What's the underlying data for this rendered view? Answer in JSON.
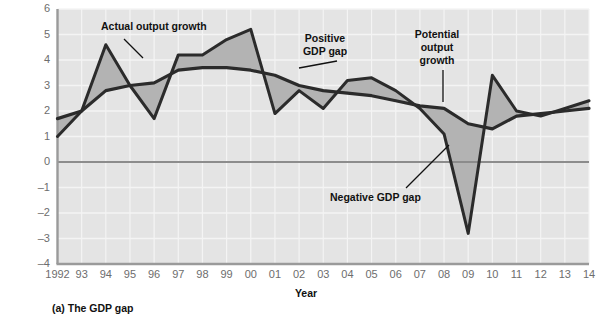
{
  "caption": "(a) The GDP gap",
  "axes": {
    "ylabel_line1": "Year-over-year",
    "ylabel_line2": "percentage change at annual rate",
    "xlabel": "Year",
    "yticks": [
      "6",
      "5",
      "4",
      "3",
      "2",
      "1",
      "0",
      "–1",
      "–2",
      "–3",
      "–4"
    ],
    "xticks": [
      "1992",
      "93",
      "94",
      "95",
      "96",
      "97",
      "98",
      "99",
      "00",
      "01",
      "02",
      "03",
      "04",
      "05",
      "06",
      "07",
      "08",
      "09",
      "10",
      "11",
      "12",
      "13",
      "14"
    ]
  },
  "annotations": {
    "actual": "Actual output growth",
    "positive": "Positive\nGDP gap",
    "potential": "Potential\noutput\ngrowth",
    "negative": "Negative GDP gap"
  },
  "colors": {
    "plot_background": "#e4e4e4",
    "gridline": "#f4f4f4",
    "axis": "#9a9a9a",
    "zero_line": "#8c8c8c",
    "series_line": "#2b2b2b",
    "gap_fill": "#b3b3b3",
    "tick_text": "#6d6d6d",
    "label_text": "#111111"
  },
  "chart_data": {
    "type": "line",
    "title": "(a) The GDP gap",
    "xlabel": "Year",
    "ylabel": "Year-over-year percentage change at annual rate",
    "xlim": [
      1992,
      2014
    ],
    "ylim": [
      -4,
      6
    ],
    "grid": true,
    "legend": "annotations",
    "x": [
      1992,
      1993,
      1994,
      1995,
      1996,
      1997,
      1998,
      1999,
      2000,
      2001,
      2002,
      2003,
      2004,
      2005,
      2006,
      2007,
      2008,
      2009,
      2010,
      2011,
      2012,
      2013,
      2014
    ],
    "series": [
      {
        "name": "Actual output growth",
        "values": [
          1.0,
          2.0,
          4.6,
          3.0,
          1.7,
          4.2,
          4.2,
          4.8,
          5.2,
          1.9,
          2.8,
          2.1,
          3.2,
          3.3,
          2.8,
          2.1,
          1.1,
          -2.8,
          3.4,
          2.0,
          1.8,
          2.1,
          2.4
        ]
      },
      {
        "name": "Potential output growth",
        "values": [
          1.7,
          2.0,
          2.8,
          3.0,
          3.1,
          3.6,
          3.7,
          3.7,
          3.6,
          3.4,
          3.0,
          2.8,
          2.7,
          2.6,
          2.4,
          2.2,
          2.1,
          1.5,
          1.3,
          1.8,
          1.9,
          2.0,
          2.1
        ]
      }
    ],
    "annotations": [
      {
        "text": "Actual output growth",
        "x": 1994,
        "y": 5.4
      },
      {
        "text": "Positive GDP gap",
        "x": 2001,
        "y": 5.0
      },
      {
        "text": "Potential output growth",
        "x": 2006.5,
        "y": 5.2
      },
      {
        "text": "Negative GDP gap",
        "x": 2008,
        "y": -1.8
      }
    ]
  }
}
